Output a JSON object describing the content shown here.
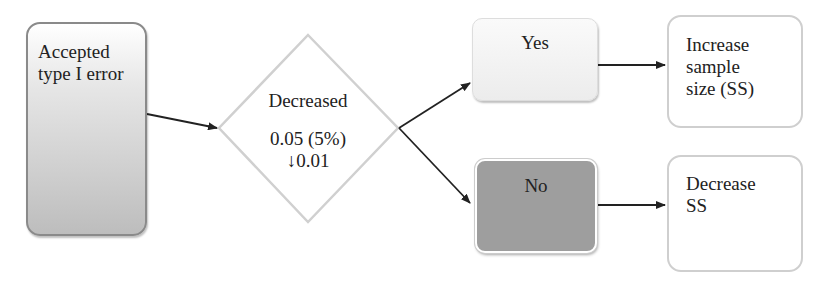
{
  "nodes": {
    "start": {
      "lines": [
        "Accepted",
        "type I error"
      ]
    },
    "decision": {
      "title": "Decreased",
      "line1": "0.05 (5%)",
      "line2": "↓0.01"
    },
    "yes": {
      "label": "Yes"
    },
    "no": {
      "label": "No"
    },
    "increase": {
      "lines": [
        "Increase",
        "sample",
        "size (SS)"
      ]
    },
    "decrease": {
      "lines": [
        "Decrease",
        "SS"
      ]
    }
  },
  "colors": {
    "arrow": "#222222",
    "diamond_border": "#cfcfcf",
    "no_fill": "#9e9e9e"
  }
}
